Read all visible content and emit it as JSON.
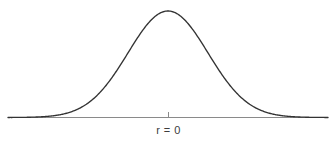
{
  "figure": {
    "background_color": "#ffffff",
    "width": 335,
    "height": 149
  },
  "labels": {
    "center_label": "r = 0"
  },
  "style": {
    "curve_color": "#333333",
    "axis_color": "#8a8a8a",
    "tick_color": "#8a8a8a",
    "text_color": "#3d3d3d"
  },
  "chart_data": {
    "type": "line",
    "title": "",
    "subtitle": "",
    "xlabel": "",
    "ylabel": "",
    "grid": false,
    "legend": "none",
    "annotations": [
      {
        "text": "r = 0",
        "x": 0,
        "y": 0,
        "position": "below-axis-center",
        "describes": "center / mean of the distribution"
      }
    ],
    "distribution": {
      "name": "normal",
      "mean": 0,
      "sigma": 1,
      "peak_value": 1.0,
      "symmetric": true
    },
    "axis": {
      "x_shown": true,
      "y_shown": false,
      "xlim": [
        -4,
        4
      ],
      "ylim": [
        0,
        1.05
      ],
      "x_ticks": [
        0
      ],
      "x_tick_labels": [
        "r = 0"
      ],
      "y_ticks": []
    },
    "series": [
      {
        "name": "normal-curve",
        "color": "#333333",
        "x": [
          -4.0,
          -3.75,
          -3.5,
          -3.25,
          -3.0,
          -2.75,
          -2.5,
          -2.25,
          -2.0,
          -1.75,
          -1.5,
          -1.25,
          -1.0,
          -0.75,
          -0.5,
          -0.25,
          0.0,
          0.25,
          0.5,
          0.75,
          1.0,
          1.25,
          1.5,
          1.75,
          2.0,
          2.25,
          2.5,
          2.75,
          3.0,
          3.25,
          3.5,
          3.75,
          4.0
        ],
        "y": [
          0.0003,
          0.0009,
          0.0022,
          0.0051,
          0.0111,
          0.0228,
          0.0439,
          0.0796,
          0.1353,
          0.2163,
          0.3247,
          0.4578,
          0.6065,
          0.7548,
          0.8825,
          0.9692,
          1.0,
          0.9692,
          0.8825,
          0.7548,
          0.6065,
          0.4578,
          0.3247,
          0.2163,
          0.1353,
          0.0796,
          0.0439,
          0.0228,
          0.0111,
          0.0051,
          0.0022,
          0.0009,
          0.0003
        ]
      }
    ]
  }
}
